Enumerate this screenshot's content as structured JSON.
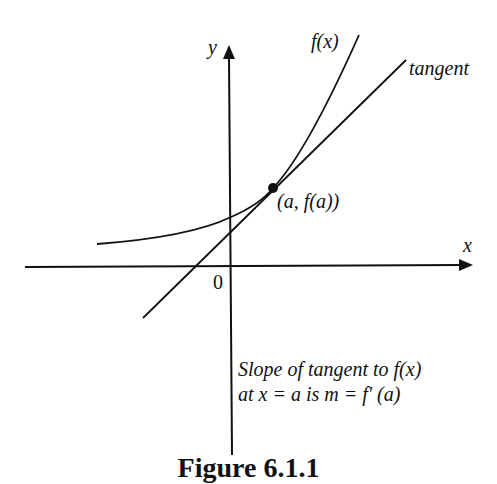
{
  "figure": {
    "caption": "Figure 6.1.1",
    "labels": {
      "y_axis": "y",
      "x_axis": "x",
      "origin": "0",
      "curve": "f(x)",
      "tangent": "tangent",
      "point": "(a, f(a))",
      "note_line1": "Slope of tangent to f(x)",
      "note_line2": "at x = a is m = f' (a)"
    },
    "colors": {
      "ink": "#111111",
      "background": "#ffffff"
    }
  }
}
